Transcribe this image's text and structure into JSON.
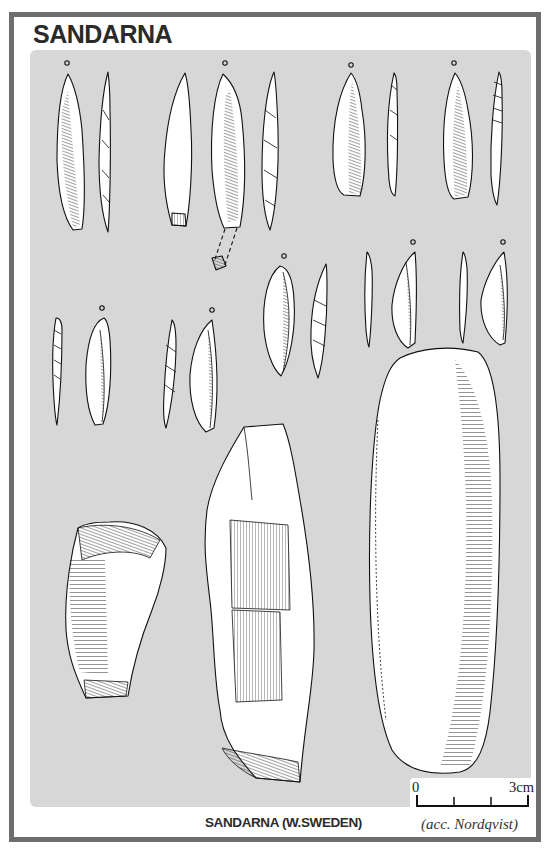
{
  "figure": {
    "title": "SANDARNA",
    "caption": "SANDARNA (W.SWEDEN)",
    "credit": "(acc. Nordqvist)",
    "colors": {
      "frame": "#6e6e6e",
      "panel": "#d7d7d7",
      "ink": "#111111",
      "paper": "#ffffff"
    }
  },
  "scale_bar": {
    "start_label": "0",
    "end_label": "3cm",
    "ticks": 4
  },
  "artifacts": [
    {
      "id": "blade-1",
      "type": "blade-point",
      "views": 2,
      "marker": "o"
    },
    {
      "id": "blade-2",
      "type": "blade-point",
      "views": 3,
      "marker": "o",
      "note": "dashed reconstruction of broken tip"
    },
    {
      "id": "blade-3",
      "type": "blade-point",
      "views": 2,
      "marker": "o"
    },
    {
      "id": "blade-4",
      "type": "blade-point",
      "views": 2,
      "marker": "o"
    },
    {
      "id": "blade-5",
      "type": "microblade",
      "views": 2,
      "marker": "o"
    },
    {
      "id": "blade-6",
      "type": "microblade",
      "views": 2,
      "marker": "o"
    },
    {
      "id": "blade-7",
      "type": "microblade",
      "views": 2,
      "marker": "o"
    },
    {
      "id": "blade-8",
      "type": "microblade",
      "views": 2,
      "marker": "o"
    },
    {
      "id": "blade-9",
      "type": "microblade",
      "views": 2,
      "marker": "o"
    },
    {
      "id": "core-1",
      "type": "scraper/core",
      "views": 1
    },
    {
      "id": "core-2",
      "type": "core",
      "views": 1
    },
    {
      "id": "pebble-1",
      "type": "elongated pebble tool",
      "views": 1
    }
  ]
}
